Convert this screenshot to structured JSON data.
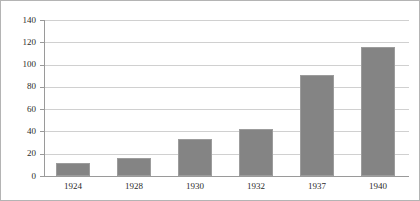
{
  "chart_data": {
    "type": "bar",
    "title": "",
    "subtitle": "",
    "xlabel": "",
    "ylabel": "",
    "categories": [
      "1924",
      "1928",
      "1930",
      "1932",
      "1937",
      "1940"
    ],
    "values": [
      12,
      16,
      33,
      42,
      91,
      116
    ],
    "series": [
      {
        "name": "",
        "values": [
          12,
          16,
          33,
          42,
          91,
          116
        ],
        "color": "#848484"
      }
    ],
    "ylim": [
      0,
      140
    ],
    "y_ticks": [
      0,
      20,
      40,
      60,
      80,
      100,
      120,
      140
    ],
    "y_tick_labels": [
      "0",
      "20",
      "40",
      "60",
      "80",
      "100",
      "120",
      "140"
    ],
    "grid": true,
    "grid_axis": "y",
    "legend": false,
    "legend_position": "none",
    "annotations": [],
    "colors": {
      "bar_fill": "#848484",
      "bar_stroke": "#9c9c9c",
      "gridline": "#d0d0d0",
      "axis": "#9a9a9a",
      "text": "#2b2b2b",
      "frame": "#b4b4b4",
      "background": "#ffffff"
    }
  }
}
